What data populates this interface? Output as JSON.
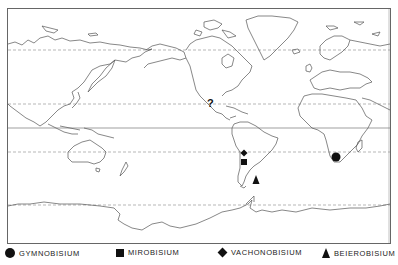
{
  "map": {
    "type": "world distribution map",
    "frame": {
      "left": 7,
      "top": 8,
      "right": 391,
      "bottom": 243
    },
    "latitude_lines": [
      {
        "name": "arctic-circle",
        "y": 50,
        "style": "dashed"
      },
      {
        "name": "tropic-of-cancer",
        "y": 104,
        "style": "dashed"
      },
      {
        "name": "equator",
        "y": 128,
        "style": "solid"
      },
      {
        "name": "tropic-of-capricorn",
        "y": 152,
        "style": "dashed"
      },
      {
        "name": "antarctic-circle",
        "y": 205,
        "style": "dashed"
      }
    ],
    "markers": [
      {
        "genus": "Gymnobisium",
        "symbol": "circle",
        "x": 336,
        "y": 157,
        "region": "southern Africa"
      },
      {
        "genus": "Mirobisium",
        "symbol": "square",
        "x": 244,
        "y": 162,
        "region": "central Chile"
      },
      {
        "genus": "Vachonobisium",
        "symbol": "diamond",
        "x": 244,
        "y": 153,
        "region": "northern Chile"
      },
      {
        "genus": "Beierobisium",
        "symbol": "triangle",
        "x": 256,
        "y": 180,
        "region": "southern Argentina"
      },
      {
        "genus": "uncertain",
        "symbol": "question-mark",
        "label": "?",
        "x": 211,
        "y": 103,
        "region": "Mexico"
      }
    ]
  },
  "legend": {
    "items": [
      {
        "symbol": "circle",
        "label": "GYMNOBISIUM"
      },
      {
        "symbol": "square",
        "label": "MIROBISIUM"
      },
      {
        "symbol": "diamond",
        "label": "VACHONOBISIUM"
      },
      {
        "symbol": "triangle",
        "label": "BEIEROBISIUM"
      }
    ]
  },
  "colors": {
    "ink": "#111111",
    "coast": "#555555",
    "lines": "#777777",
    "background": "#ffffff"
  }
}
